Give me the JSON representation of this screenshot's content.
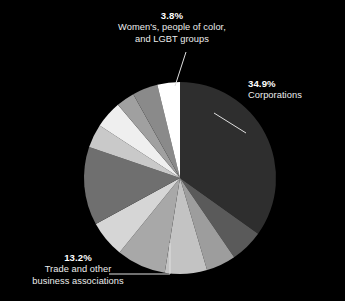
{
  "background_color": "#000000",
  "chart_data": {
    "type": "pie",
    "title": "",
    "subtitle": "",
    "xlabel": "",
    "ylabel": "",
    "legend_position": "none",
    "grid": false,
    "units": "percent",
    "center": {
      "x": 180,
      "y": 178
    },
    "radius": 96,
    "start_angle_deg": 0,
    "direction": "clockwise",
    "labeled_slices": [
      {
        "label": "Corporations",
        "value": 34.9,
        "display_value": "34.9%",
        "color": "#2e2e2e",
        "callout": "corporations"
      },
      {
        "label": "Women's, people of color, and LGBT groups",
        "value": 3.8,
        "display_value": "3.8%",
        "color": "#ffffff",
        "callout": "women-poc-lgbt"
      },
      {
        "label": "Trade and other business associations",
        "value": 13.2,
        "display_value": "13.2%",
        "color": "#6f6f6f",
        "callout": "trade-associations"
      }
    ],
    "categories": [
      "Corporations",
      "Unlabeled slice 1",
      "Unlabeled slice 2",
      "Unlabeled slice 3",
      "Unlabeled slice 4",
      "Unlabeled slice 5",
      "Trade and other business associations",
      "Unlabeled slice 6",
      "Unlabeled slice 7",
      "Unlabeled slice 8",
      "Unlabeled slice 9",
      "Women's, people of color, and LGBT groups"
    ],
    "values": [
      34.9,
      5.6,
      5.0,
      7.1,
      8.3,
      6.2,
      13.2,
      4.0,
      4.6,
      3.1,
      4.3,
      3.8
    ],
    "colors": [
      "#2e2e2e",
      "#5a5a5a",
      "#9d9d9d",
      "#c3c3c3",
      "#a8a8a8",
      "#d6d6d6",
      "#6f6f6f",
      "#c9c9c9",
      "#efefef",
      "#a0a0a0",
      "#8a8a8a",
      "#ffffff"
    ]
  },
  "callouts": {
    "women_poc_lgbt": {
      "percent": "3.8%",
      "line1": "Women's, people of color,",
      "line2": "and LGBT groups"
    },
    "corporations": {
      "percent": "34.9%",
      "line1": "Corporations"
    },
    "trade_associations": {
      "percent": "13.2%",
      "line1": "Trade and other",
      "line2": "business associations"
    }
  }
}
